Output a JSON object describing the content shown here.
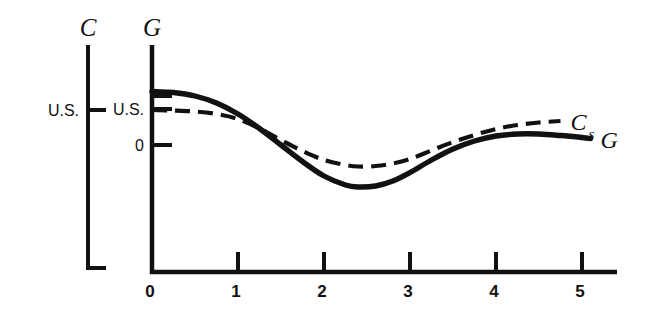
{
  "chart_data": {
    "type": "line",
    "title": "",
    "subtitle": "",
    "xlabel": "",
    "ylabel": "G",
    "secondary_axis_label": "C",
    "xlim": [
      0,
      5.4
    ],
    "ylim": [
      -1.55,
      1.35
    ],
    "grid": false,
    "legend_position": "right-end-of-curve",
    "x_ticks": [
      "0",
      "1",
      "2",
      "3",
      "4",
      "5"
    ],
    "x_tick_values": [
      0,
      1,
      2,
      3,
      4,
      5
    ],
    "y_ticks": [
      "U.S.",
      "0"
    ],
    "y_tick_values": [
      0.55,
      0.0
    ],
    "y_extra_tick_values": [
      0.93
    ],
    "c_axis_ticks": [
      "U.S."
    ],
    "c_axis_tick_values": [
      0.55
    ],
    "series": [
      {
        "name": "G",
        "label": "G",
        "style": "solid",
        "color": "#111111",
        "x": [
          0.0,
          0.25,
          0.5,
          0.75,
          1.0,
          1.25,
          1.5,
          1.75,
          2.0,
          2.25,
          2.4,
          2.6,
          2.8,
          3.0,
          3.25,
          3.5,
          3.75,
          4.0,
          4.25,
          4.5,
          4.75,
          5.0,
          5.1
        ],
        "y": [
          1.07,
          1.05,
          0.98,
          0.84,
          0.62,
          0.33,
          0.0,
          -0.33,
          -0.62,
          -0.8,
          -0.84,
          -0.82,
          -0.72,
          -0.55,
          -0.3,
          -0.08,
          0.08,
          0.18,
          0.22,
          0.22,
          0.19,
          0.15,
          0.13
        ]
      },
      {
        "name": "Cs",
        "label": "C",
        "label_subscript": "s",
        "style": "dashed",
        "color": "#111111",
        "x": [
          0.0,
          0.25,
          0.5,
          0.75,
          1.0,
          1.25,
          1.5,
          1.75,
          2.0,
          2.25,
          2.4,
          2.6,
          2.8,
          3.0,
          3.25,
          3.5,
          3.75,
          4.0,
          4.25,
          4.5,
          4.75
        ],
        "y": [
          0.7,
          0.69,
          0.67,
          0.62,
          0.52,
          0.33,
          0.1,
          -0.12,
          -0.3,
          -0.4,
          -0.43,
          -0.42,
          -0.37,
          -0.28,
          -0.11,
          0.06,
          0.2,
          0.32,
          0.4,
          0.45,
          0.48
        ]
      }
    ],
    "annotations": [
      {
        "name": "c-axis-title",
        "text": "C"
      },
      {
        "name": "g-axis-title",
        "text": "G"
      }
    ]
  },
  "axes": {
    "c_axis": {
      "title": "C",
      "tick_label": "U.S."
    },
    "g_axis": {
      "title": "G",
      "tick_label_us": "U.S.",
      "tick_label_zero": "0"
    },
    "x_axis": {
      "tick_0": "0",
      "tick_1": "1",
      "tick_2": "2",
      "tick_3": "3",
      "tick_4": "4",
      "tick_5": "5"
    }
  },
  "curve_labels": {
    "cs_main": "C",
    "cs_sub": "s",
    "g": "G"
  },
  "colors": {
    "ink": "#111111",
    "background": "#ffffff"
  }
}
